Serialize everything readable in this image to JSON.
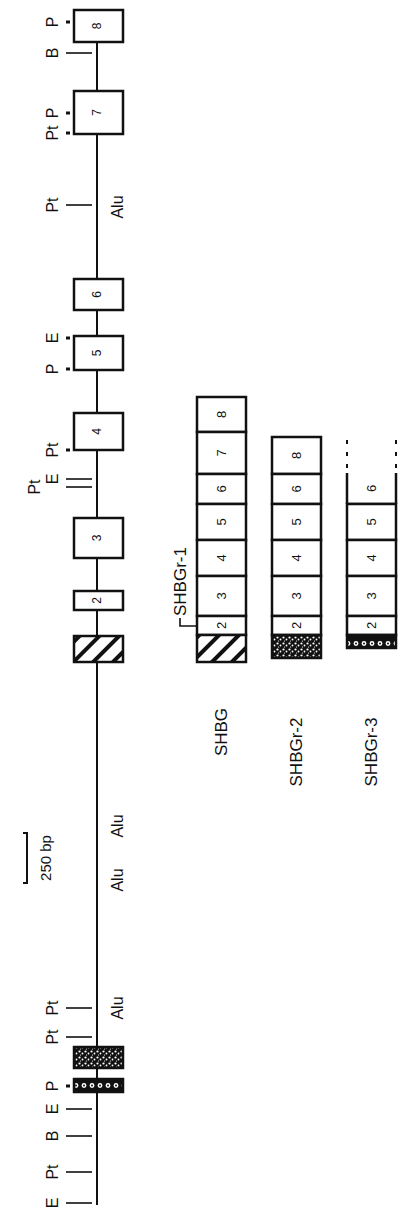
{
  "scale_bar": {
    "label": "250 bp"
  },
  "gene": {
    "exons": [
      {
        "label": "8",
        "y1": 10,
        "y2": 42,
        "fill": "plain"
      },
      {
        "label": "7",
        "y1": 91,
        "y2": 134,
        "fill": "plain"
      },
      {
        "label": "6",
        "y1": 279,
        "y2": 310,
        "fill": "plain"
      },
      {
        "label": "5",
        "y1": 336,
        "y2": 370,
        "fill": "plain"
      },
      {
        "label": "4",
        "y1": 413,
        "y2": 450,
        "fill": "plain"
      },
      {
        "label": "3",
        "y1": 518,
        "y2": 558,
        "fill": "plain"
      },
      {
        "label": "2",
        "y1": 591,
        "y2": 610,
        "fill": "plain"
      },
      {
        "label": "",
        "y1": 636,
        "y2": 662,
        "fill": "hatched"
      },
      {
        "label": "",
        "y1": 1047,
        "y2": 1068,
        "fill": "stippled"
      },
      {
        "label": "",
        "y1": 1079,
        "y2": 1092,
        "fill": "circles"
      }
    ],
    "sites": [
      {
        "label": "P",
        "y": 22,
        "tick": "dot"
      },
      {
        "label": "B",
        "y": 53,
        "tick": "line"
      },
      {
        "label": "P",
        "y": 113,
        "tick": "dot"
      },
      {
        "label": "Pt",
        "y": 133,
        "tick": "dot"
      },
      {
        "label": "Pt",
        "y": 205,
        "tick": "line"
      },
      {
        "label": "E",
        "y": 338,
        "tick": "dot"
      },
      {
        "label": "P",
        "y": 369,
        "tick": "dot"
      },
      {
        "label": "Pt",
        "y": 450,
        "tick": "dot"
      },
      {
        "label": "E",
        "y": 479,
        "tick": "line"
      },
      {
        "label": "Pt",
        "y": 487,
        "tick": "line"
      },
      {
        "label": "Pt",
        "y": 1008,
        "tick": "line"
      },
      {
        "label": "Pt",
        "y": 1037,
        "tick": "line"
      },
      {
        "label": "P",
        "y": 1086,
        "tick": "dot"
      },
      {
        "label": "E",
        "y": 1109,
        "tick": "line"
      },
      {
        "label": "B",
        "y": 1136,
        "tick": "line"
      },
      {
        "label": "Pt",
        "y": 1172,
        "tick": "line"
      },
      {
        "label": "E",
        "y": 1203,
        "tick": "line"
      }
    ],
    "alu": [
      {
        "label": "Alu",
        "y": 207
      },
      {
        "label": "Alu",
        "y": 826
      },
      {
        "label": "Alu",
        "y": 880
      },
      {
        "label": "Alu",
        "y": 1008
      }
    ]
  },
  "transcripts": [
    {
      "name": "SHBG",
      "x": 197,
      "segments": [
        {
          "label": "8",
          "y1": 397,
          "y2": 432
        },
        {
          "label": "7",
          "y1": 432,
          "y2": 474
        },
        {
          "label": "6",
          "y1": 474,
          "y2": 504
        },
        {
          "label": "5",
          "y1": 504,
          "y2": 540
        },
        {
          "label": "4",
          "y1": 540,
          "y2": 576
        },
        {
          "label": "3",
          "y1": 576,
          "y2": 616
        },
        {
          "label": "2",
          "y1": 616,
          "y2": 635
        },
        {
          "label": "",
          "y1": 635,
          "y2": 662,
          "fill": "hatched"
        }
      ]
    },
    {
      "name": "SHBGr-2",
      "x": 272,
      "segments": [
        {
          "label": "8",
          "y1": 437,
          "y2": 474
        },
        {
          "label": "6",
          "y1": 474,
          "y2": 504
        },
        {
          "label": "5",
          "y1": 504,
          "y2": 540
        },
        {
          "label": "4",
          "y1": 540,
          "y2": 576
        },
        {
          "label": "3",
          "y1": 576,
          "y2": 616
        },
        {
          "label": "2",
          "y1": 616,
          "y2": 635
        },
        {
          "label": "",
          "y1": 635,
          "y2": 658,
          "fill": "stippled"
        }
      ]
    },
    {
      "name": "SHBGr-3",
      "x": 347,
      "open_top": true,
      "segments": [
        {
          "label": "6",
          "y1": 473,
          "y2": 504
        },
        {
          "label": "5",
          "y1": 504,
          "y2": 540
        },
        {
          "label": "4",
          "y1": 540,
          "y2": 576
        },
        {
          "label": "3",
          "y1": 576,
          "y2": 616
        },
        {
          "label": "2",
          "y1": 616,
          "y2": 635
        },
        {
          "label": "",
          "y1": 635,
          "y2": 648,
          "fill": "circles"
        }
      ]
    }
  ],
  "transcript_callout": {
    "label": "SHBGr-1"
  }
}
